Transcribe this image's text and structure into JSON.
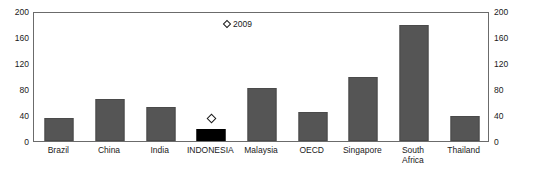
{
  "chart_data": {
    "type": "bar",
    "title": "",
    "xlabel": "",
    "ylabel": "",
    "ylim": [
      0,
      200
    ],
    "yticks": [
      0,
      40,
      80,
      120,
      160,
      200
    ],
    "grid": false,
    "dual_axis": true,
    "legend_position": "top-center",
    "categories": [
      "Brazil",
      "China",
      "India",
      "INDONESIA",
      "Malaysia",
      "OECD",
      "Singapore",
      "South\nAfrica",
      "Thailand"
    ],
    "series": [
      {
        "name": "bars",
        "type": "bar",
        "values": [
          36,
          64,
          52,
          19,
          82,
          45,
          98,
          178,
          38
        ],
        "highlight_index": 3,
        "color": "#555555",
        "highlight_color": "#000000"
      },
      {
        "name": "2009",
        "type": "marker",
        "marker": "diamond",
        "values": [
          null,
          null,
          null,
          38,
          null,
          null,
          null,
          null,
          null
        ]
      }
    ],
    "legend": [
      {
        "label": "2009",
        "marker": "diamond"
      }
    ]
  },
  "axis": {
    "left_ticks": [
      "200",
      "160",
      "120",
      "80",
      "40",
      "0"
    ],
    "right_ticks": [
      "200",
      "160",
      "120",
      "80",
      "40",
      "0"
    ]
  },
  "caption": {
    "text": ""
  }
}
